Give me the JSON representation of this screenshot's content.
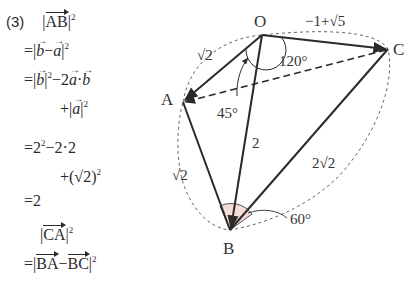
{
  "problem_number": "(3)",
  "math": {
    "ab_heading": {
      "bar": "AB",
      "sq": "2"
    },
    "ab_steps": [
      {
        "prefix": "=|",
        "parts": [
          "b",
          "−",
          "a"
        ],
        "suffix": "|",
        "sq": "2"
      },
      {
        "prefix": "=|",
        "b": "b",
        "mid": "|",
        "sq1": "2",
        "rest": "−2",
        "a": "a",
        "dot": "·",
        "b2": "b"
      },
      {
        "prefix": "+|",
        "a": "a",
        "suffix": "|",
        "sq": "2"
      }
    ],
    "numeric": {
      "line1": "=2",
      "sq1": "2",
      "rest1": "−2·2",
      "line2": "+(√2)",
      "sq2": "2",
      "result": "=2"
    },
    "ca_heading": {
      "bar": "CA",
      "sq": "2"
    },
    "ca_step": {
      "prefix": "=|",
      "v1": "BA",
      "minus": "−",
      "v2": "BC",
      "suffix": "|",
      "sq": "2"
    }
  },
  "diagram": {
    "points": {
      "O": "O",
      "A": "A",
      "B": "B",
      "C": "C"
    },
    "edge_labels": {
      "OA": "√2",
      "OC": "−1+√5",
      "OB": "2",
      "AB": "√2",
      "BC": "2√2"
    },
    "angle_labels": {
      "AOC": "120°",
      "AOB": "45°",
      "ABC": "60°"
    },
    "colors": {
      "stroke": "#2a2a2a",
      "dashed": "#555555",
      "angle_fill": "#f6dcd6"
    }
  }
}
